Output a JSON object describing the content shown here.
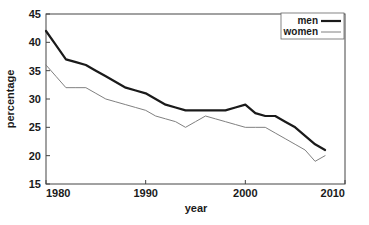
{
  "chart_data": {
    "type": "line",
    "title": "",
    "xlabel": "year",
    "ylabel": "percentage",
    "xlim": [
      1980,
      2010
    ],
    "ylim": [
      15,
      45
    ],
    "xticks": [
      1980,
      1990,
      2000,
      2010
    ],
    "yticks": [
      15,
      20,
      25,
      30,
      35,
      40,
      45
    ],
    "grid": false,
    "legend_position": "top-right",
    "x": [
      1980,
      1981,
      1982,
      1983,
      1984,
      1985,
      1986,
      1987,
      1988,
      1989,
      1990,
      1991,
      1992,
      1993,
      1994,
      1995,
      1996,
      1997,
      1998,
      1999,
      2000,
      2001,
      2002,
      2003,
      2004,
      2005,
      2006,
      2007,
      2008
    ],
    "series": [
      {
        "name": "men",
        "color": "#1a1a1a",
        "width": 2.2,
        "values": [
          42,
          39.5,
          37,
          36.5,
          36,
          35,
          34,
          33,
          32,
          31.5,
          31,
          30,
          29,
          28.5,
          28,
          28,
          28,
          28,
          28,
          28.5,
          29,
          27.5,
          27,
          27,
          26,
          25,
          23.5,
          22,
          21
        ]
      },
      {
        "name": "women",
        "color": "#808080",
        "width": 1.0,
        "values": [
          36,
          34,
          32,
          32,
          32,
          31,
          30,
          29.5,
          29,
          28.5,
          28,
          27,
          26.5,
          26,
          25,
          26,
          27,
          26.5,
          26,
          25.5,
          25,
          25,
          25,
          24,
          23,
          22,
          21,
          19,
          20
        ]
      }
    ]
  },
  "legend": {
    "items": [
      {
        "label": "men"
      },
      {
        "label": "women"
      }
    ]
  },
  "axes": {
    "x_tick_labels": [
      "1980",
      "1990",
      "2000",
      "2010"
    ],
    "y_tick_labels": [
      "15",
      "20",
      "25",
      "30",
      "35",
      "40",
      "45"
    ],
    "x_title": "year",
    "y_title": "percentage"
  }
}
